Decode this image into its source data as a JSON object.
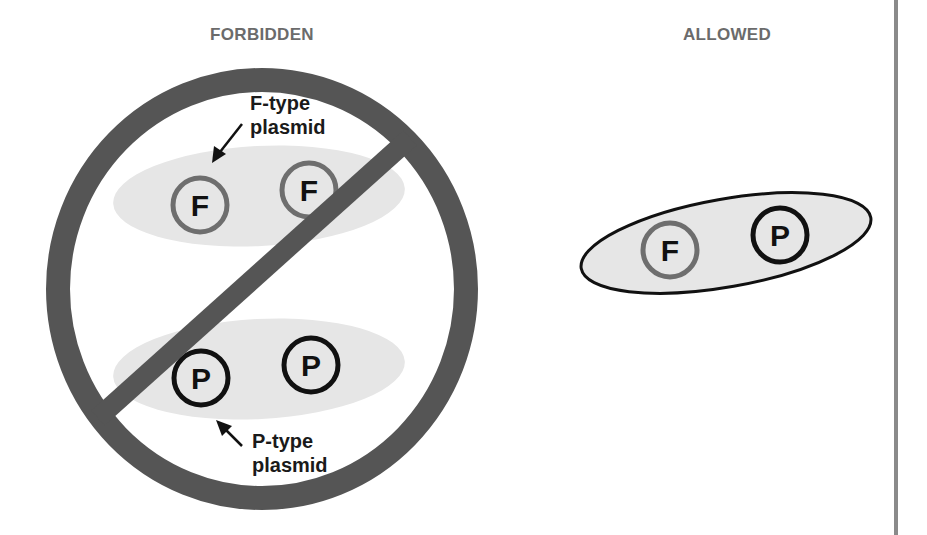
{
  "panels": {
    "forbidden": {
      "title": "FORBIDDEN",
      "f_label_line1": "F-type",
      "f_label_line2": "plasmid",
      "p_label_line1": "P-type",
      "p_label_line2": "plasmid",
      "plasmids": [
        {
          "letter": "F",
          "type": "F-type"
        },
        {
          "letter": "F",
          "type": "F-type"
        },
        {
          "letter": "P",
          "type": "P-type"
        },
        {
          "letter": "P",
          "type": "P-type"
        }
      ]
    },
    "allowed": {
      "title": "ALLOWED",
      "plasmids": [
        {
          "letter": "F",
          "type": "F-type"
        },
        {
          "letter": "P",
          "type": "P-type"
        }
      ]
    }
  },
  "symbols": {
    "prohibition": "no-symbol",
    "arrow": "arrow-icon"
  },
  "colors": {
    "prohibition_sign": "#555555",
    "cell_fill": "#e6e6e6",
    "f_plasmid_ring": "#6e6e6e",
    "p_plasmid_ring": "#111111",
    "heading_text": "#6b6b6b",
    "divider": "#8a8a8a"
  }
}
